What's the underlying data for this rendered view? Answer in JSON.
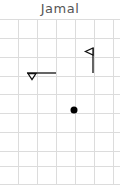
{
  "title": "Jamal",
  "grid": {
    "x0": 0,
    "y0": 19,
    "cell": 18.8,
    "cols": 6,
    "rows": 9,
    "color": "#dcdcdc"
  },
  "symbols": [
    {
      "type": "horizontal-line-with-down-triangle",
      "x1": 27,
      "x2": 56,
      "y": 73
    },
    {
      "type": "flag-vertical-with-left-triangle",
      "x": 93,
      "y1": 48,
      "y2": 73
    },
    {
      "type": "dot",
      "cx": 74,
      "cy": 110,
      "r": 3.5
    }
  ],
  "colors": {
    "stroke": "#111111",
    "text": "#555555"
  }
}
